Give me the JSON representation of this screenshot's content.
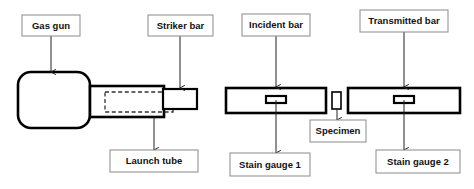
{
  "diagram": {
    "canvas": {
      "width": 474,
      "height": 189
    },
    "colors": {
      "background": "#ffffff",
      "part_stroke": "#000000",
      "label_border": "#8a8a8a",
      "label_text": "#111111",
      "arrow": "#222222",
      "dashed_stroke": "#333333"
    },
    "labels": {
      "gas_gun": "Gas gun",
      "striker_bar": "Striker bar",
      "incident_bar": "Incident bar",
      "transmitted_bar": "Transmitted bar",
      "launch_tube": "Launch tube",
      "specimen": "Specimen",
      "strain_gauge_1": "Stain gauge 1",
      "strain_gauge_2": "Stain gauge 2"
    },
    "parts": {
      "gas_gun": {
        "shape": "rounded-rectangle",
        "x": 18,
        "y": 72,
        "width": 72,
        "height": 56,
        "corner_radius": 13
      },
      "launch_tube": {
        "shape": "rectangle",
        "x": 90,
        "y": 86,
        "width": 74,
        "height": 31
      },
      "striker_bar_inner": {
        "shape": "dashed-rectangle",
        "x": 105,
        "y": 92,
        "width": 68,
        "height": 20
      },
      "striker_bar_outer": {
        "shape": "rectangle",
        "x": 163,
        "y": 89,
        "width": 34,
        "height": 20
      },
      "incident_bar": {
        "shape": "rectangle",
        "x": 226,
        "y": 88,
        "width": 100,
        "height": 25
      },
      "transmitted_bar": {
        "shape": "rectangle",
        "x": 348,
        "y": 88,
        "width": 112,
        "height": 25
      },
      "specimen": {
        "shape": "rectangle",
        "x": 332,
        "y": 92,
        "width": 9,
        "height": 17
      },
      "gauge_1": {
        "shape": "rectangle",
        "x": 266,
        "y": 96,
        "width": 20,
        "height": 7
      },
      "gauge_2": {
        "shape": "rectangle",
        "x": 394,
        "y": 96,
        "width": 20,
        "height": 7
      }
    },
    "label_boxes": {
      "gas_gun": {
        "x": 22,
        "y": 15,
        "width": 58,
        "height": 21
      },
      "striker_bar": {
        "x": 148,
        "y": 15,
        "width": 65,
        "height": 21
      },
      "incident_bar": {
        "x": 242,
        "y": 14,
        "width": 68,
        "height": 22
      },
      "transmitted_bar": {
        "x": 360,
        "y": 10,
        "width": 88,
        "height": 22
      },
      "launch_tube": {
        "x": 110,
        "y": 150,
        "width": 88,
        "height": 22
      },
      "specimen": {
        "x": 310,
        "y": 120,
        "width": 56,
        "height": 22
      },
      "strain_gauge_1": {
        "x": 230,
        "y": 153,
        "width": 80,
        "height": 23
      },
      "strain_gauge_2": {
        "x": 376,
        "y": 150,
        "width": 84,
        "height": 23
      }
    },
    "arrows": [
      {
        "name": "gas-gun",
        "x1": 51,
        "y1": 36,
        "x2": 51,
        "y2": 72
      },
      {
        "name": "striker-bar",
        "x1": 180,
        "y1": 36,
        "x2": 180,
        "y2": 88
      },
      {
        "name": "incident-bar",
        "x1": 276,
        "y1": 36,
        "x2": 276,
        "y2": 87
      },
      {
        "name": "transmitted-bar",
        "x1": 404,
        "y1": 32,
        "x2": 404,
        "y2": 87
      },
      {
        "name": "launch-tube",
        "x1": 154,
        "y1": 117,
        "x2": 154,
        "y2": 150
      },
      {
        "name": "specimen",
        "x1": 337,
        "y1": 109,
        "x2": 337,
        "y2": 120
      },
      {
        "name": "strain-gauge-1",
        "x1": 276,
        "y1": 100,
        "x2": 276,
        "y2": 153
      },
      {
        "name": "strain-gauge-2",
        "x1": 404,
        "y1": 100,
        "x2": 404,
        "y2": 150
      }
    ]
  }
}
